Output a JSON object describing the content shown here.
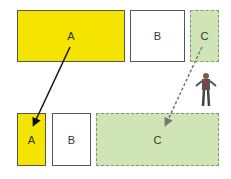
{
  "top_row": {
    "a": {
      "label": "A",
      "color": "#f5e400"
    },
    "b": {
      "label": "B",
      "color": "#ffffff"
    },
    "c": {
      "label": "C",
      "color": "#cfe5b6"
    }
  },
  "bottom_row": {
    "a": {
      "label": "A",
      "color": "#f5e400"
    },
    "b": {
      "label": "B",
      "color": "#ffffff"
    },
    "c": {
      "label": "C",
      "color": "#cfe5b6"
    }
  },
  "arrows": [
    {
      "from": "top A",
      "to": "bottom A",
      "style": "solid"
    },
    {
      "from": "top C",
      "to": "bottom C",
      "style": "dashed"
    }
  ],
  "figure": "person-icon"
}
